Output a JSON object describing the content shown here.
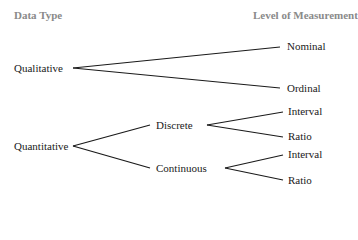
{
  "headers": {
    "data_type": "Data Type",
    "level_of_measurement": "Level of Measurement"
  },
  "nodes": {
    "qualitative": "Qualitative",
    "quantitative": "Quantitative",
    "nominal": "Nominal",
    "ordinal": "Ordinal",
    "discrete": "Discrete",
    "continuous": "Continuous",
    "discrete_interval": "Interval",
    "discrete_ratio": "Ratio",
    "continuous_interval": "Interval",
    "continuous_ratio": "Ratio"
  },
  "colors": {
    "header_text": "#8a8a8a",
    "node_text": "#1a1a1a",
    "line": "#1a1a1a"
  }
}
